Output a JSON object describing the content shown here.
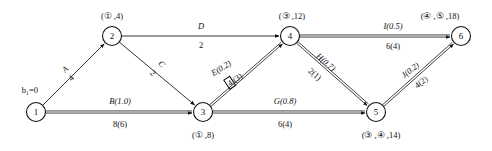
{
  "diagram": {
    "type": "network-flow-graph",
    "nodes": [
      {
        "id": "1",
        "num": "1",
        "x": 36,
        "y": 112,
        "label": "b₁=0",
        "lx": 30,
        "ly": 90,
        "label_pos": "above-left"
      },
      {
        "id": "2",
        "num": "2",
        "x": 112,
        "y": 36,
        "label": "(① ,4)",
        "lx": 112,
        "ly": 16,
        "label_pos": "above"
      },
      {
        "id": "3",
        "num": "3",
        "x": 203,
        "y": 112,
        "label": "(① ,8)",
        "lx": 203,
        "ly": 135,
        "label_pos": "below"
      },
      {
        "id": "4",
        "num": "4",
        "x": 290,
        "y": 36,
        "label": "(③ ,12)",
        "lx": 292,
        "ly": 16,
        "label_pos": "above"
      },
      {
        "id": "5",
        "num": "5",
        "x": 376,
        "y": 112,
        "label": "(③ ,④ ,14)",
        "lx": 381,
        "ly": 135,
        "label_pos": "below"
      },
      {
        "id": "6",
        "num": "6",
        "x": 461,
        "y": 36,
        "label": "(④ ,⑤ ,18)",
        "lx": 440,
        "ly": 16,
        "label_pos": "above"
      }
    ],
    "edges": [
      {
        "id": "A",
        "from": "1",
        "to": "2",
        "style": "single",
        "name": "A",
        "value": "4",
        "nx": 65,
        "ny": 69,
        "vx": 71,
        "vy": 78,
        "rotate": -45
      },
      {
        "id": "B",
        "from": "1",
        "to": "3",
        "style": "double",
        "name": "B(1.0)",
        "value": "8(6)",
        "nx": 120,
        "ny": 101,
        "vx": 120,
        "vy": 124,
        "rotate": 0
      },
      {
        "id": "C",
        "from": "2",
        "to": "3",
        "style": "single",
        "name": "C",
        "value": "2",
        "nx": 162,
        "ny": 64,
        "vx": 153,
        "vy": 73,
        "rotate": 45
      },
      {
        "id": "D",
        "from": "2",
        "to": "4",
        "style": "single",
        "name": "D",
        "value": "2",
        "nx": 201,
        "ny": 26,
        "vx": 201,
        "vy": 45,
        "rotate": 0
      },
      {
        "id": "E",
        "from": "3",
        "to": "4",
        "style": "double",
        "name": "E(0.2)",
        "value": "4(3)",
        "nx": 221,
        "ny": 68,
        "vx": 234,
        "vy": 80,
        "rotate": -33,
        "boxed_first": true
      },
      {
        "id": "G",
        "from": "3",
        "to": "5",
        "style": "double",
        "name": "G(0.8)",
        "value": "6(4)",
        "nx": 285,
        "ny": 101,
        "vx": 285,
        "vy": 124,
        "rotate": 0
      },
      {
        "id": "H",
        "from": "4",
        "to": "5",
        "style": "double",
        "name": "H(0.7)",
        "value": "2(1)",
        "nx": 326,
        "ny": 62,
        "vx": 315,
        "vy": 74,
        "rotate": 40
      },
      {
        "id": "I",
        "from": "4",
        "to": "6",
        "style": "double",
        "name": "I(0.5)",
        "value": "6(4)",
        "nx": 393,
        "ny": 26,
        "vx": 393,
        "vy": 46,
        "rotate": 0
      },
      {
        "id": "J",
        "from": "5",
        "to": "6",
        "style": "double",
        "name": "J(0.2)",
        "value": "4(2)",
        "nx": 410,
        "ny": 70,
        "vx": 421,
        "vy": 82,
        "rotate": -38
      }
    ],
    "colors": {
      "stroke": "#111111",
      "fill": "#ffffff"
    }
  }
}
